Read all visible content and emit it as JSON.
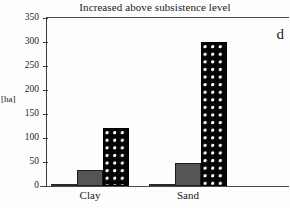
{
  "figure": {
    "panel_letter": "d",
    "background": "#ffffff"
  },
  "chart_data": {
    "type": "bar",
    "title": "Increased above subsistence level",
    "xlabel": "",
    "ylabel": "[ha]",
    "ylim": [
      0,
      350
    ],
    "ytick_labels": [
      "0",
      "50",
      "100",
      "150",
      "200",
      "250",
      "300",
      "350"
    ],
    "ytick_values": [
      0,
      50,
      100,
      150,
      200,
      250,
      300,
      350
    ],
    "grid": false,
    "legend": "none",
    "categories": [
      "Clay",
      "Sand"
    ],
    "series": [
      {
        "name": "series-1",
        "style": "white",
        "color": "#ffffff",
        "values": [
          0,
          2
        ]
      },
      {
        "name": "series-2",
        "style": "solid-gray",
        "color": "#555555",
        "values": [
          33,
          47
        ]
      },
      {
        "name": "series-3",
        "style": "black-dotted",
        "color": "#050505",
        "values": [
          120,
          299
        ]
      }
    ]
  }
}
